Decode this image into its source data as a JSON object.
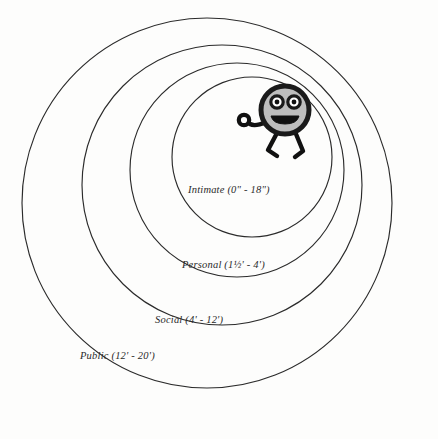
{
  "diagram": {
    "background_color": "#fdfdfc",
    "stroke_color": "#2b2b2b",
    "zones": [
      {
        "id": "intimate",
        "label": "Intimate (0\" - 18\")",
        "name": "Intimate",
        "range": "0\" - 18\"",
        "cx": 252,
        "cy": 157,
        "r": 80
      },
      {
        "id": "personal",
        "label": "Personal (1½' - 4')",
        "name": "Personal",
        "range": "1½' - 4'",
        "cx": 237,
        "cy": 170,
        "r": 107
      },
      {
        "id": "social",
        "label": "Social (4' - 12')",
        "name": "Social",
        "range": "4' - 12'",
        "cx": 222,
        "cy": 185,
        "r": 140
      },
      {
        "id": "public",
        "label": "Public (12' - 20')",
        "name": "Public",
        "range": "12' - 20'",
        "cx": 207,
        "cy": 203,
        "r": 185
      }
    ],
    "figure": {
      "name": "cartoon-person",
      "head_fill": "#bdbdbd",
      "outline_color": "#1a1a1a",
      "head_cx": 285,
      "head_cy": 110,
      "head_r": 25
    }
  }
}
